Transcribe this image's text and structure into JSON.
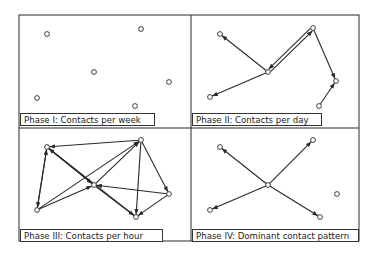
{
  "figure": {
    "frame": {
      "left": 19,
      "top": 15,
      "right": 359,
      "bottom": 241,
      "mid_x": 191,
      "mid_y": 128
    },
    "colors": {
      "line": "#2a2a2a",
      "node_fill": "#ffffff",
      "background": "#ffffff"
    }
  },
  "panels": [
    {
      "id": "phase-1",
      "caption": "Phase I: Contacts per week",
      "caption_box": {
        "x": 20,
        "y": 113,
        "w": 135
      },
      "nodes": [
        [
          47,
          34
        ],
        [
          141,
          29
        ],
        [
          94,
          72
        ],
        [
          169,
          82
        ],
        [
          37,
          98
        ],
        [
          135,
          106
        ]
      ],
      "edges": []
    },
    {
      "id": "phase-2",
      "caption": "Phase II: Contacts per day",
      "caption_box": {
        "x": 192,
        "y": 113,
        "w": 130
      },
      "nodes": [
        [
          220,
          34
        ],
        [
          313,
          28
        ],
        [
          268,
          72
        ],
        [
          336,
          81
        ],
        [
          210,
          97
        ],
        [
          319,
          106
        ]
      ],
      "edges": [
        {
          "from": [
            268,
            72
          ],
          "to": [
            220,
            34
          ],
          "arrow": "end"
        },
        {
          "from": [
            268,
            72
          ],
          "to": [
            210,
            97
          ],
          "arrow": "end"
        },
        {
          "from": [
            268,
            72
          ],
          "to": [
            313,
            28
          ],
          "arrow": "end",
          "double": true
        },
        {
          "from": [
            313,
            28
          ],
          "to": [
            268,
            72
          ],
          "arrow": "end",
          "double": true
        },
        {
          "from": [
            313,
            28
          ],
          "to": [
            336,
            81
          ],
          "arrow": "end"
        },
        {
          "from": [
            319,
            106
          ],
          "to": [
            336,
            81
          ],
          "arrow": "end"
        }
      ]
    },
    {
      "id": "phase-3",
      "caption": "Phase III: Contacts per hour",
      "caption_box": {
        "x": 20,
        "y": 229,
        "w": 143
      },
      "nodes": [
        [
          47,
          147
        ],
        [
          141,
          140
        ],
        [
          94,
          185
        ],
        [
          169,
          194
        ],
        [
          37,
          210
        ],
        [
          136,
          217
        ]
      ],
      "edges": [
        {
          "from": [
            141,
            140
          ],
          "to": [
            47,
            147
          ],
          "arrow": "end"
        },
        {
          "from": [
            47,
            147
          ],
          "to": [
            37,
            210
          ],
          "arrow": "end"
        },
        {
          "from": [
            37,
            210
          ],
          "to": [
            47,
            147
          ],
          "arrow": "end"
        },
        {
          "from": [
            47,
            147
          ],
          "to": [
            94,
            185
          ],
          "arrow": "end"
        },
        {
          "from": [
            94,
            185
          ],
          "to": [
            47,
            147
          ],
          "arrow": "end"
        },
        {
          "from": [
            37,
            210
          ],
          "to": [
            141,
            140
          ],
          "arrow": "end"
        },
        {
          "from": [
            37,
            210
          ],
          "to": [
            94,
            185
          ],
          "arrow": "end"
        },
        {
          "from": [
            94,
            185
          ],
          "to": [
            141,
            140
          ],
          "arrow": "end"
        },
        {
          "from": [
            141,
            140
          ],
          "to": [
            136,
            217
          ],
          "arrow": "end"
        },
        {
          "from": [
            141,
            140
          ],
          "to": [
            169,
            194
          ],
          "arrow": "end"
        },
        {
          "from": [
            169,
            194
          ],
          "to": [
            94,
            185
          ],
          "arrow": "end"
        },
        {
          "from": [
            94,
            185
          ],
          "to": [
            136,
            217
          ],
          "arrow": "end"
        },
        {
          "from": [
            169,
            194
          ],
          "to": [
            136,
            217
          ],
          "arrow": "end"
        },
        {
          "from": [
            47,
            147
          ],
          "to": [
            136,
            217
          ],
          "arrow": "none"
        }
      ]
    },
    {
      "id": "phase-4",
      "caption": "Phase IV: Dominant contact pattern",
      "caption_box": {
        "x": 192,
        "y": 229,
        "w": 167
      },
      "nodes": [
        [
          220,
          147
        ],
        [
          313,
          140
        ],
        [
          268,
          185
        ],
        [
          337,
          194
        ],
        [
          210,
          210
        ],
        [
          320,
          217
        ]
      ],
      "edges": [
        {
          "from": [
            268,
            185
          ],
          "to": [
            220,
            147
          ],
          "arrow": "end"
        },
        {
          "from": [
            268,
            185
          ],
          "to": [
            313,
            140
          ],
          "arrow": "end"
        },
        {
          "from": [
            268,
            185
          ],
          "to": [
            210,
            210
          ],
          "arrow": "end"
        },
        {
          "from": [
            268,
            185
          ],
          "to": [
            320,
            217
          ],
          "arrow": "end"
        }
      ]
    }
  ]
}
